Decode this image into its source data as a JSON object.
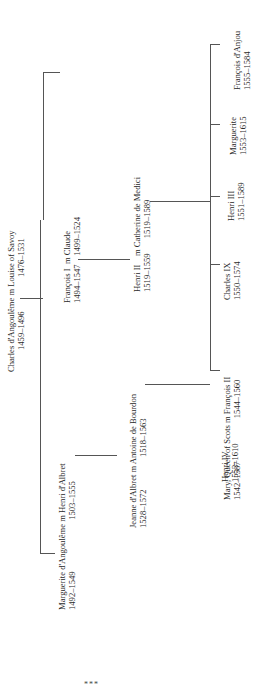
{
  "diagram": {
    "type": "family-tree",
    "orientation": "rotated-90-ccw",
    "nodes": {
      "charles": {
        "line1": "Charles d'Angoulême m Louise of Savoy",
        "line2": "1459–1496                1476–1531"
      },
      "marguerite_a": {
        "line1": "Marguerite d'Angoulême m Henri d'Albret",
        "line2": "1492–1549                        1503–1555"
      },
      "francois1": {
        "line1": "François I  m Claude",
        "line2": "1494–1547    1499–1524"
      },
      "jeanne": {
        "line1": "Jeanne d'Albret m Antoine de Bourdon",
        "line2": "1528–1572               1518–1563"
      },
      "henri2": {
        "line1": "Henri II    m Catherine de Medici",
        "line2": "1519–1559       1519–1589"
      },
      "henri4": {
        "line1": "Henri IV",
        "line2": "1553–1610"
      },
      "mary": {
        "line1": "Mary, Queen of Scots m François II",
        "line2": "1542–1587                    1544–1560"
      },
      "charles9": {
        "line1": "Charles IX",
        "line2": "1550–1574"
      },
      "henri3": {
        "line1": "Henri III",
        "line2": "1551–1589"
      },
      "marguerite_v": {
        "line1": "Marguerite",
        "line2": "1553–1615"
      },
      "francois_anjou": {
        "line1": "François d'Anjou",
        "line2": "1555–1584"
      }
    },
    "footer_mark": "***"
  }
}
